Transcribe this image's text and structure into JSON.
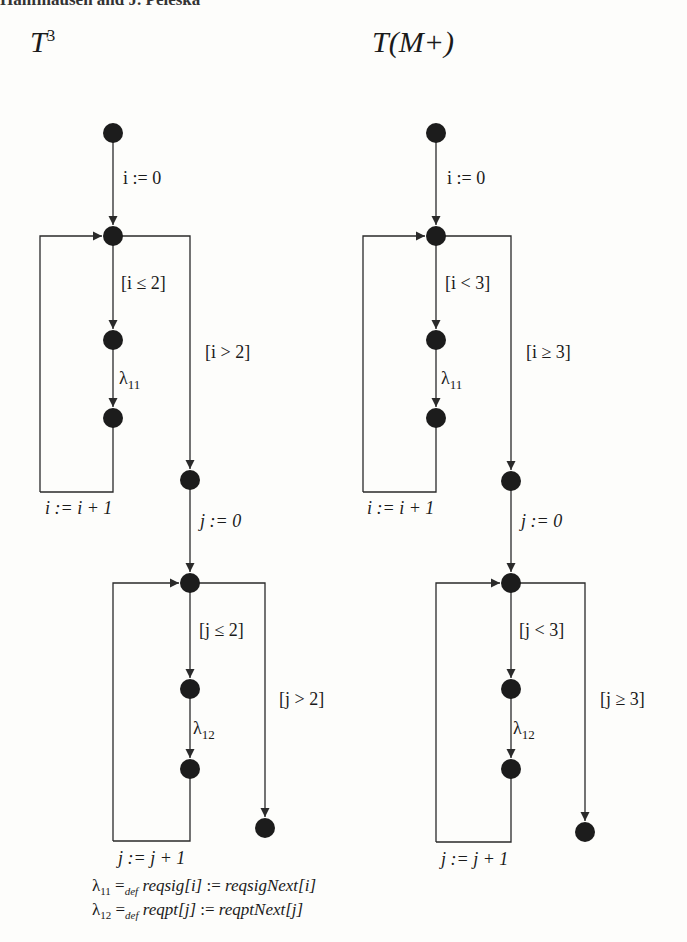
{
  "header": {
    "text": "Hanflhausen and J. Peleska"
  },
  "diagrams": [
    {
      "title": "T",
      "title_sup": "3",
      "labels": {
        "init": "i := 0",
        "guard_in": "[i ≤ 2]",
        "guard_out": "[i > 2]",
        "action1": "λ",
        "action1_sub": "11",
        "incr1": "i := i + 1",
        "init2": "j := 0",
        "guard2_in": "[j ≤ 2]",
        "guard2_out": "[j > 2]",
        "action2": "λ",
        "action2_sub": "12",
        "incr2": "j := j + 1"
      }
    },
    {
      "title": "T(M+)",
      "labels": {
        "init": "i := 0",
        "guard_in": "[i < 3]",
        "guard_out": "[i ≥ 3]",
        "action1": "λ",
        "action1_sub": "11",
        "incr1": "i := i + 1",
        "init2": "j := 0",
        "guard2_in": "[j < 3]",
        "guard2_out": "[j ≥ 3]",
        "action2": "λ",
        "action2_sub": "12",
        "incr2": "j := j + 1"
      }
    }
  ],
  "definitions": [
    {
      "symbol": "λ",
      "sub": "11",
      "eq": "=",
      "eq_sub": "def",
      "lhs": "reqsig[i]",
      "assign": " := ",
      "rhs": "reqsigNext[i]"
    },
    {
      "symbol": "λ",
      "sub": "12",
      "eq": "=",
      "eq_sub": "def",
      "lhs": "reqpt[j]",
      "assign": " := ",
      "rhs": "reqptNext[j]"
    }
  ],
  "colors": {
    "node": "#1c1c1c",
    "edge": "#2a2a2a",
    "background": "#fdfdfb"
  }
}
